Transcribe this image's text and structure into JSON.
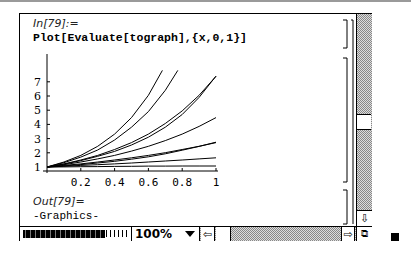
{
  "notebook": {
    "input_label": "In[79]:=",
    "input_code": "Plot[Evaluate[tograph],{x,0,1}]",
    "output_label": "Out[79]=",
    "output_value": "-Graphics-"
  },
  "statusbar": {
    "zoom_level": "100%",
    "left_arrow_icon": "⇦",
    "right_arrow_icon": "⇨",
    "down_arrow_icon": "⇩",
    "resize_icon": "⧉"
  },
  "chart_data": {
    "type": "line",
    "title": "",
    "xlabel": "",
    "ylabel": "",
    "xlim": [
      0,
      1
    ],
    "ylim": [
      0.7,
      7.8
    ],
    "x_ticks": [
      "0.2",
      "0.4",
      "0.6",
      "0.8",
      "1"
    ],
    "y_ticks": [
      "1",
      "2",
      "3",
      "4",
      "5",
      "6",
      "7"
    ],
    "grid": false,
    "x": [
      0,
      0.1,
      0.2,
      0.3,
      0.4,
      0.5,
      0.6,
      0.7,
      0.8,
      0.9,
      1.0
    ],
    "series": [
      {
        "name": "curve1",
        "values": [
          1,
          1.35,
          1.82,
          2.46,
          3.32,
          4.48,
          6.05,
          8.17,
          null,
          null,
          null
        ]
      },
      {
        "name": "curve2",
        "values": [
          1,
          1.3,
          1.7,
          2.2,
          2.9,
          3.8,
          4.9,
          6.4,
          8.3,
          null,
          null
        ]
      },
      {
        "name": "curve3",
        "values": [
          1,
          1.22,
          1.49,
          1.82,
          2.23,
          2.72,
          3.32,
          4.06,
          4.95,
          6.05,
          7.39
        ]
      },
      {
        "name": "curve4",
        "values": [
          1,
          1.2,
          1.45,
          1.75,
          2.1,
          2.55,
          3.1,
          3.8,
          4.7,
          5.9,
          7.4
        ]
      },
      {
        "name": "curve5",
        "values": [
          1,
          1.16,
          1.35,
          1.57,
          1.82,
          2.12,
          2.46,
          2.86,
          3.32,
          3.86,
          4.48
        ]
      },
      {
        "name": "curve6",
        "values": [
          1,
          1.11,
          1.22,
          1.35,
          1.49,
          1.65,
          1.82,
          2.01,
          2.23,
          2.46,
          2.72
        ]
      },
      {
        "name": "curve7",
        "values": [
          1,
          1.08,
          1.17,
          1.28,
          1.4,
          1.55,
          1.72,
          1.93,
          2.18,
          2.45,
          2.75
        ]
      },
      {
        "name": "curve8",
        "values": [
          1,
          1.05,
          1.11,
          1.16,
          1.22,
          1.28,
          1.35,
          1.42,
          1.49,
          1.57,
          1.65
        ]
      },
      {
        "name": "curve9",
        "values": [
          1,
          1.01,
          1.02,
          1.03,
          1.04,
          1.05,
          1.06,
          1.06,
          1.07,
          1.07,
          1.07
        ]
      }
    ]
  }
}
